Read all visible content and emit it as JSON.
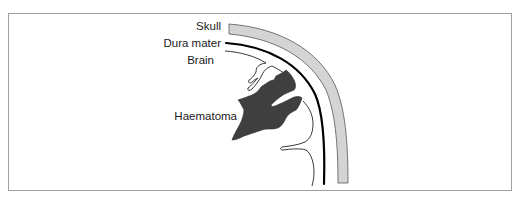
{
  "diagram": {
    "type": "anatomical-cross-section",
    "labels": {
      "skull": "Skull",
      "dura_mater": "Dura mater",
      "brain": "Brain",
      "haematoma": "Haematoma"
    },
    "colors": {
      "frame_border": "#a0a0a0",
      "skull_fill": "#d4d4d4",
      "skull_outline": "#555555",
      "dura": "#000000",
      "brain_outline": "#222222",
      "haematoma_fill": "#3f3f3f",
      "background": "#ffffff"
    }
  }
}
